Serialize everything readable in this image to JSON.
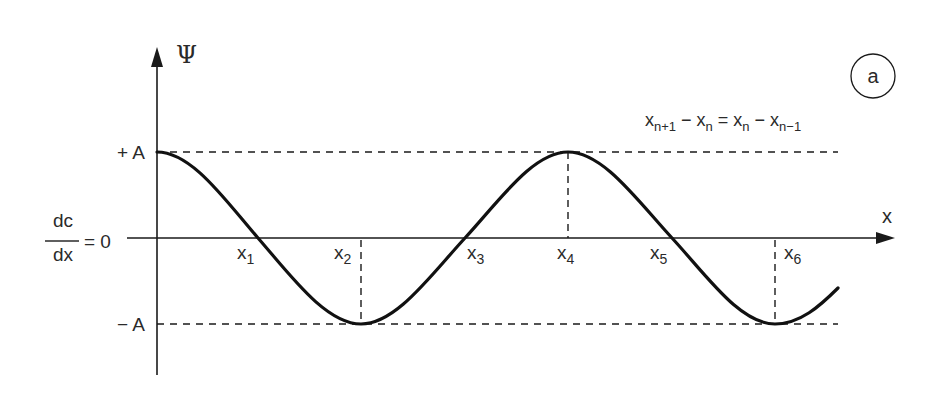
{
  "diagram": {
    "panel_label": "a",
    "y_axis_label": "Ψ",
    "x_axis_label": "x",
    "plus_amplitude_label": "+ A",
    "minus_amplitude_label": "− A",
    "baseline_label": {
      "numerator": "dc",
      "denominator": "dx",
      "equals": "= 0"
    },
    "equation": {
      "t1": "x",
      "s1": "n+1",
      "op1": " − ",
      "t2": "x",
      "s2": "n",
      "eq": " = ",
      "t3": "x",
      "s3": "n",
      "op2": " − ",
      "t4": "x",
      "s4": "n−1"
    },
    "points": [
      {
        "base": "x",
        "sub": "1"
      },
      {
        "base": "x",
        "sub": "2"
      },
      {
        "base": "x",
        "sub": "3"
      },
      {
        "base": "x",
        "sub": "4"
      },
      {
        "base": "x",
        "sub": "5"
      },
      {
        "base": "x",
        "sub": "6"
      }
    ],
    "colors": {
      "ink": "#1a1a1a",
      "text": "#2a2a2a",
      "background": "#ffffff"
    }
  }
}
